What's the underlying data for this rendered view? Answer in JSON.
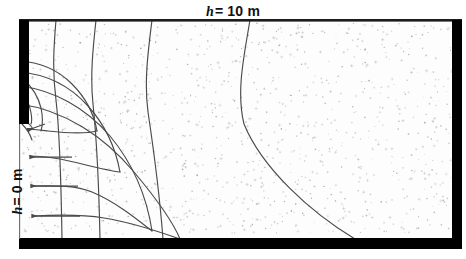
{
  "figure": {
    "type": "flow-net",
    "labels": {
      "top": {
        "symbol": "h",
        "equals": "= 10 m",
        "full": "h = 10 m"
      },
      "left": {
        "symbol": "h",
        "equals": "= 0 m",
        "full": "h = 0 m"
      }
    },
    "colors": {
      "boundary": "#000000",
      "net_line": "#4a4a4a",
      "soil_fill": "#fdfdfd",
      "stipple": "#9a9a9a",
      "background": "#ffffff",
      "arrow": "#4a4a4a"
    },
    "domain": {
      "left": 19,
      "top": 20,
      "right": 462,
      "bottom": 239,
      "wall_x": 19,
      "wall_bottom_y": 124,
      "top_border_thickness": 3,
      "bottom_border_thickness": 11,
      "right_border_thickness": 10,
      "wall_thickness": 10
    },
    "head_boundary": {
      "upstream_head_m": 10,
      "downstream_head_m": 0,
      "head_drop_m": 10
    },
    "equipotentials": {
      "count": 7,
      "top_intersections_x": [
        56,
        96,
        152,
        250
      ],
      "bottom_intersections_x": [
        62,
        100,
        163,
        355
      ],
      "description": "Curves running from the upper (h = 10 m) boundary down to the lower impermeable base"
    },
    "flowlines": {
      "count": 5,
      "description": "Curves sweeping around the toe of the cutoff wall from the upstream surface to the downstream exit face",
      "exit_arrow_count": 4,
      "exit_arrows_y": [
        130,
        157,
        186,
        216
      ]
    },
    "stipple": {
      "dot_count": 1150,
      "seed": 20240517,
      "meaning": "soil / sand hatching"
    }
  }
}
